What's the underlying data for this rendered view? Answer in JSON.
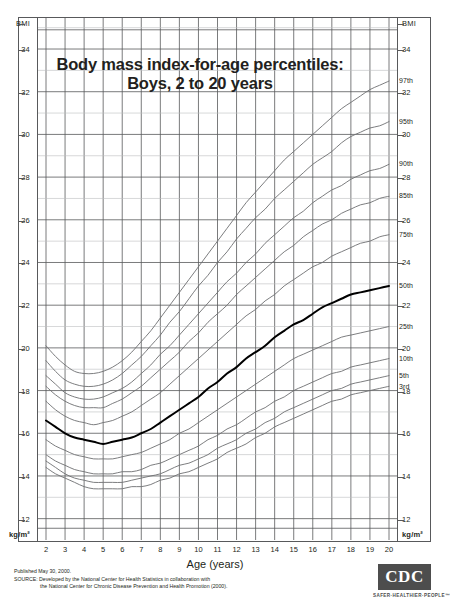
{
  "title": {
    "line1": "Body mass index-for-age percentiles:",
    "line2": "Boys, 2 to 20 years"
  },
  "axes": {
    "y_header": "BMI",
    "y_unit": "kg/m²",
    "x_title": "Age (years)",
    "y_ticks": [
      34,
      32,
      30,
      28,
      26,
      24,
      22,
      20,
      18,
      16,
      14,
      12
    ],
    "x_ticks": [
      2,
      3,
      4,
      5,
      6,
      7,
      8,
      9,
      10,
      11,
      12,
      13,
      14,
      15,
      16,
      17,
      18,
      19,
      20
    ],
    "ylim": [
      11,
      35.5
    ],
    "xlim": [
      2,
      20
    ]
  },
  "footer": {
    "published": "Published May 30, 2000.",
    "source_line1": "SOURCE: Developed by the National Center for Health Statistics in collaboration with",
    "source_line2": "the National Center for Chronic Disease Prevention and Health Promotion (2000)."
  },
  "logo": {
    "text": "CDC",
    "tagline": "SAFER·HEALTHIER·PEOPLE™"
  },
  "colors": {
    "grid_major": "#58595b",
    "grid_minor": "#bcbec0",
    "curve": "#6d6e71",
    "curve_bold": "#000000"
  },
  "chart_data": {
    "type": "line",
    "title": "Body mass index-for-age percentiles: Boys, 2 to 20 years",
    "xlabel": "Age (years)",
    "ylabel": "BMI",
    "xlim": [
      2,
      20
    ],
    "ylim": [
      11,
      35.5
    ],
    "grid": true,
    "legend": "right-edge-inline-labels",
    "x": [
      2,
      2.5,
      3,
      3.5,
      4,
      4.5,
      5,
      5.5,
      6,
      6.5,
      7,
      7.5,
      8,
      8.5,
      9,
      9.5,
      10,
      10.5,
      11,
      11.5,
      12,
      12.5,
      13,
      13.5,
      14,
      14.5,
      15,
      15.5,
      16,
      16.5,
      17,
      17.5,
      18,
      18.5,
      19,
      19.5,
      20
    ],
    "series": [
      {
        "name": "97th",
        "label": "97th",
        "values": [
          20.1,
          19.6,
          19.2,
          18.9,
          18.8,
          18.8,
          18.9,
          19.1,
          19.4,
          19.8,
          20.3,
          20.8,
          21.4,
          22.0,
          22.6,
          23.2,
          23.8,
          24.4,
          25.0,
          25.6,
          26.2,
          26.8,
          27.3,
          27.8,
          28.3,
          28.8,
          29.2,
          29.6,
          30.0,
          30.4,
          30.8,
          31.2,
          31.5,
          31.8,
          32.1,
          32.3,
          32.5
        ]
      },
      {
        "name": "95th",
        "label": "95th",
        "values": [
          19.4,
          18.9,
          18.5,
          18.3,
          18.2,
          18.2,
          18.3,
          18.5,
          18.8,
          19.2,
          19.6,
          20.1,
          20.6,
          21.2,
          21.7,
          22.3,
          22.9,
          23.4,
          24.0,
          24.5,
          25.1,
          25.6,
          26.1,
          26.5,
          27.0,
          27.4,
          27.8,
          28.2,
          28.6,
          28.9,
          29.2,
          29.6,
          29.9,
          30.1,
          30.3,
          30.4,
          30.6
        ]
      },
      {
        "name": "90th",
        "label": "90th",
        "values": [
          18.7,
          18.3,
          17.9,
          17.7,
          17.6,
          17.6,
          17.7,
          17.9,
          18.1,
          18.4,
          18.8,
          19.2,
          19.7,
          20.1,
          20.6,
          21.1,
          21.6,
          22.1,
          22.6,
          23.1,
          23.5,
          24.0,
          24.4,
          24.9,
          25.3,
          25.7,
          26.1,
          26.4,
          26.8,
          27.1,
          27.4,
          27.6,
          27.9,
          28.1,
          28.3,
          28.4,
          28.6
        ]
      },
      {
        "name": "85th",
        "label": "85th",
        "values": [
          18.2,
          17.8,
          17.5,
          17.3,
          17.2,
          17.2,
          17.2,
          17.4,
          17.6,
          17.9,
          18.2,
          18.6,
          19.0,
          19.4,
          19.8,
          20.3,
          20.7,
          21.2,
          21.6,
          22.0,
          22.5,
          22.9,
          23.3,
          23.7,
          24.1,
          24.5,
          24.8,
          25.2,
          25.5,
          25.8,
          26.0,
          26.3,
          26.5,
          26.7,
          26.8,
          27.0,
          27.1
        ]
      },
      {
        "name": "75th",
        "label": "75th",
        "values": [
          17.5,
          17.1,
          16.8,
          16.6,
          16.5,
          16.4,
          16.5,
          16.6,
          16.8,
          17.0,
          17.3,
          17.6,
          17.9,
          18.3,
          18.7,
          19.1,
          19.5,
          19.9,
          20.3,
          20.7,
          21.1,
          21.5,
          21.8,
          22.2,
          22.5,
          22.9,
          23.2,
          23.5,
          23.8,
          24.0,
          24.3,
          24.5,
          24.7,
          24.9,
          25.0,
          25.2,
          25.3
        ]
      },
      {
        "name": "50th",
        "label": "50th",
        "values": [
          16.6,
          16.3,
          16.0,
          15.8,
          15.7,
          15.6,
          15.5,
          15.6,
          15.7,
          15.8,
          16.0,
          16.2,
          16.5,
          16.8,
          17.1,
          17.4,
          17.7,
          18.1,
          18.4,
          18.8,
          19.1,
          19.5,
          19.8,
          20.1,
          20.5,
          20.8,
          21.1,
          21.3,
          21.6,
          21.9,
          22.1,
          22.3,
          22.5,
          22.6,
          22.7,
          22.8,
          22.9
        ],
        "bold": true
      },
      {
        "name": "25th",
        "label": "25th",
        "values": [
          15.7,
          15.4,
          15.2,
          15.0,
          14.9,
          14.8,
          14.8,
          14.8,
          14.9,
          15.0,
          15.1,
          15.3,
          15.5,
          15.7,
          16.0,
          16.2,
          16.5,
          16.8,
          17.1,
          17.4,
          17.7,
          18.0,
          18.3,
          18.6,
          18.9,
          19.2,
          19.5,
          19.7,
          19.9,
          20.1,
          20.3,
          20.5,
          20.6,
          20.7,
          20.8,
          20.9,
          21.0
        ]
      },
      {
        "name": "10th",
        "label": "10th",
        "values": [
          15.0,
          14.7,
          14.5,
          14.3,
          14.2,
          14.1,
          14.1,
          14.1,
          14.2,
          14.2,
          14.3,
          14.5,
          14.6,
          14.8,
          15.0,
          15.2,
          15.4,
          15.7,
          15.9,
          16.2,
          16.4,
          16.7,
          17.0,
          17.2,
          17.5,
          17.7,
          18.0,
          18.2,
          18.4,
          18.6,
          18.8,
          18.9,
          19.1,
          19.2,
          19.3,
          19.4,
          19.5
        ]
      },
      {
        "name": "5th",
        "label": "5th",
        "values": [
          14.7,
          14.4,
          14.1,
          13.9,
          13.8,
          13.7,
          13.7,
          13.7,
          13.7,
          13.8,
          13.9,
          14.0,
          14.1,
          14.3,
          14.5,
          14.6,
          14.8,
          15.0,
          15.3,
          15.5,
          15.7,
          16.0,
          16.2,
          16.5,
          16.7,
          17.0,
          17.2,
          17.4,
          17.6,
          17.8,
          18.0,
          18.1,
          18.3,
          18.4,
          18.5,
          18.6,
          18.7
        ]
      },
      {
        "name": "3rd",
        "label": "3rd",
        "values": [
          14.4,
          14.1,
          13.9,
          13.7,
          13.5,
          13.4,
          13.4,
          13.4,
          13.4,
          13.5,
          13.5,
          13.6,
          13.8,
          13.9,
          14.1,
          14.2,
          14.4,
          14.6,
          14.8,
          15.1,
          15.3,
          15.5,
          15.8,
          16.0,
          16.3,
          16.5,
          16.7,
          16.9,
          17.1,
          17.3,
          17.5,
          17.6,
          17.8,
          17.9,
          18.0,
          18.1,
          18.2
        ]
      }
    ]
  }
}
